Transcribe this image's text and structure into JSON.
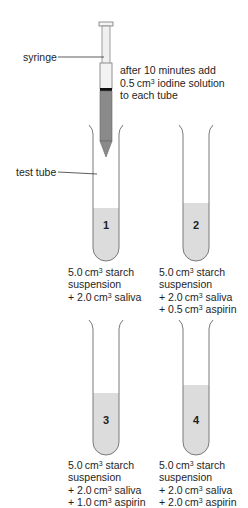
{
  "labels": {
    "syringe": "syringe",
    "test_tube": "test tube",
    "instruction_line1": "after 10 minutes add",
    "instruction_line2_value": "0.5",
    "instruction_line2_unit": "cm",
    "instruction_line2_sup": "3",
    "instruction_line2_rest": " iodine solution",
    "instruction_line3": "to each tube"
  },
  "tubes": [
    {
      "number": "1",
      "liquid_level_px": 208,
      "lines": [
        {
          "prefix": "5.0",
          "unit": "cm",
          "sup": "3",
          "rest": " starch"
        },
        {
          "prefix": "suspension",
          "unit": "",
          "sup": "",
          "rest": ""
        },
        {
          "prefix": "+ 2.0",
          "unit": "cm",
          "sup": "3",
          "rest": " saliva"
        }
      ]
    },
    {
      "number": "2",
      "liquid_level_px": 203,
      "lines": [
        {
          "prefix": "5.0",
          "unit": "cm",
          "sup": "3",
          "rest": " starch"
        },
        {
          "prefix": "suspension",
          "unit": "",
          "sup": "",
          "rest": ""
        },
        {
          "prefix": "+ 2.0",
          "unit": "cm",
          "sup": "3",
          "rest": " saliva"
        },
        {
          "prefix": "+ 0.5",
          "unit": "cm",
          "sup": "3",
          "rest": " aspirin"
        }
      ]
    },
    {
      "number": "3",
      "liquid_level_px": 393,
      "lines": [
        {
          "prefix": "5.0",
          "unit": "cm",
          "sup": "3",
          "rest": " starch"
        },
        {
          "prefix": "suspension",
          "unit": "",
          "sup": "",
          "rest": ""
        },
        {
          "prefix": "+ 2.0",
          "unit": "cm",
          "sup": "3",
          "rest": " saliva"
        },
        {
          "prefix": "+ 1.0",
          "unit": "cm",
          "sup": "3",
          "rest": " aspirin"
        }
      ]
    },
    {
      "number": "4",
      "liquid_level_px": 385,
      "lines": [
        {
          "prefix": "5.0",
          "unit": "cm",
          "sup": "3",
          "rest": " starch"
        },
        {
          "prefix": "suspension",
          "unit": "",
          "sup": "",
          "rest": ""
        },
        {
          "prefix": "+ 2.0",
          "unit": "cm",
          "sup": "3",
          "rest": " saliva"
        },
        {
          "prefix": "+ 2.0",
          "unit": "cm",
          "sup": "3",
          "rest": " aspirin"
        }
      ]
    }
  ],
  "colors": {
    "tube_outline": "#7a7a7a",
    "liquid": "#dcdcdc",
    "syringe_liquid": "#8a8a8a",
    "plunger_band": "#111111",
    "leader_line": "#333333"
  }
}
